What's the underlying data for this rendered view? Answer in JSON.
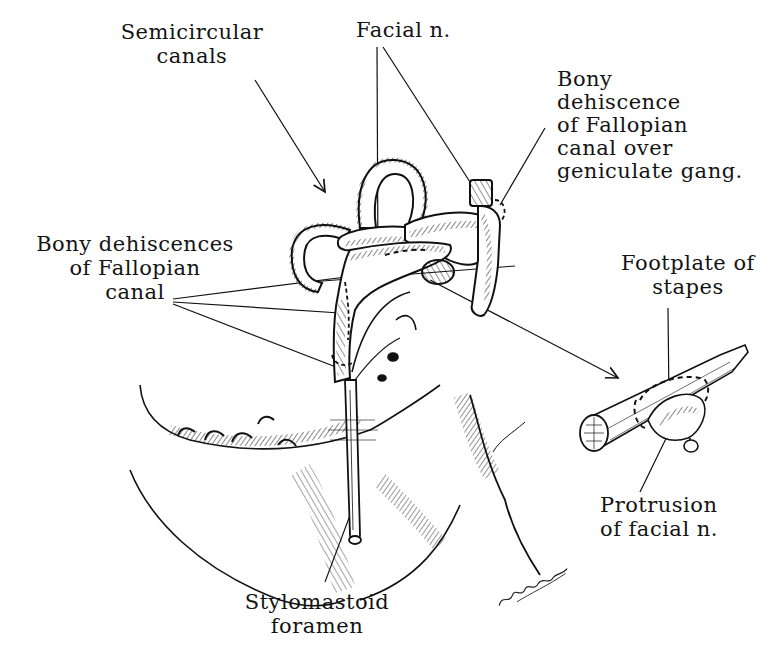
{
  "figure": {
    "type": "anatomical line illustration",
    "ink_color": "#111111",
    "background": "#ffffff"
  },
  "labels": {
    "semicircular_canals": "Semicircular\ncanals",
    "facial_n": "Facial n.",
    "geniculate_dehiscence": "Bony\ndehiscence\nof Fallopian\ncanal over\ngeniculate gang.",
    "bony_dehiscences": "Bony dehiscences\nof Fallopian\ncanal",
    "footplate_of_stapes": "Footplate of\nstapes",
    "protrusion_of_facial_n": "Protrusion\nof facial n.",
    "stylomastoid_foramen": "Stylomastoid\nforamen"
  },
  "signature": "signature"
}
